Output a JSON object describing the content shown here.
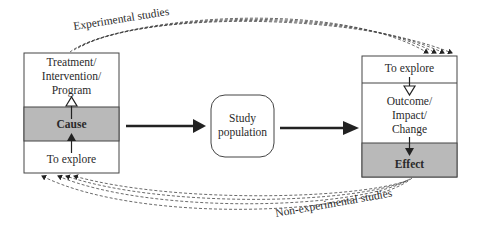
{
  "diagram": {
    "cause_box": {
      "top_label_lines": [
        "Treatment/",
        "Intervention/",
        "Program"
      ],
      "middle_label": "Cause",
      "bottom_label": "To explore"
    },
    "study_population": {
      "label_lines": [
        "Study",
        "population"
      ]
    },
    "effect_box": {
      "top_label": "To explore",
      "middle_label_lines": [
        "Outcome/",
        "Impact/",
        "Change"
      ],
      "bottom_label": "Effect"
    },
    "curves": {
      "top_label": "Experimental studies",
      "bottom_label": "Non-experimental studies"
    },
    "colors": {
      "shaded": "#b9b9b9",
      "stroke": "#333333",
      "background": "#ffffff"
    }
  }
}
